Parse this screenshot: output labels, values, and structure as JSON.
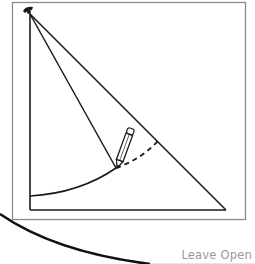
{
  "diagram": {
    "elements": [
      "frame",
      "compass-pivot",
      "right-triangle",
      "compass-leg",
      "pencil",
      "solid-arc",
      "dashed-arc",
      "large-outer-curve"
    ],
    "colors": {
      "stroke": "#1a1a1a",
      "frame": "#8a8a8a",
      "label": "#9a9a9a"
    }
  },
  "footer": {
    "leave_open_label": "Leave Open"
  }
}
